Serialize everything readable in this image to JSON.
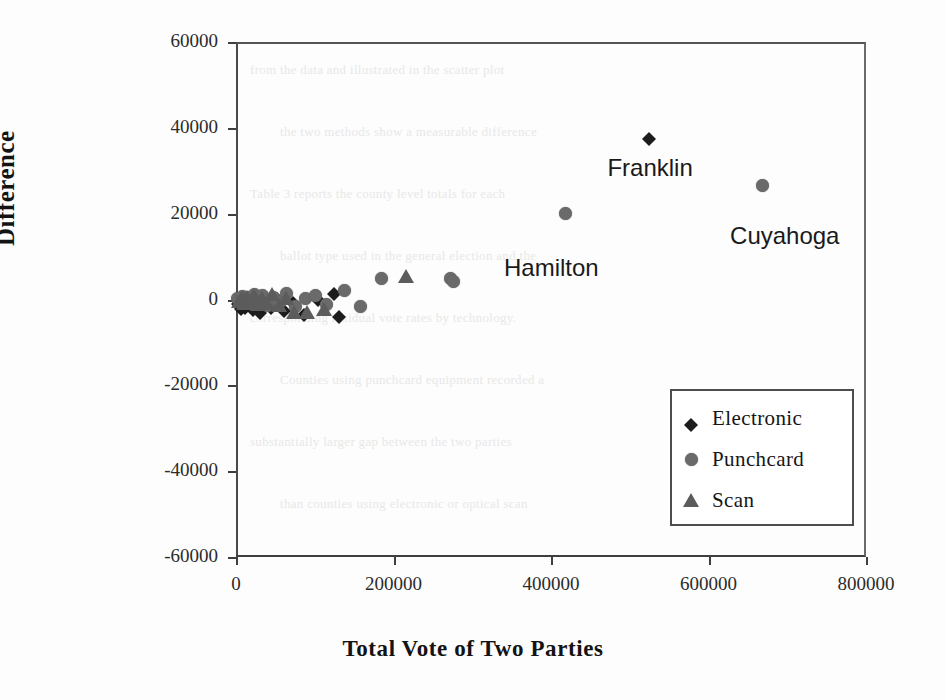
{
  "chart_data": {
    "type": "scatter",
    "title": "",
    "xlabel": "Total Vote of Two Parties",
    "ylabel": "Difference",
    "xlim": [
      0,
      800000
    ],
    "ylim": [
      -60000,
      60000
    ],
    "xticks": [
      "0",
      "200000",
      "400000",
      "600000",
      "800000"
    ],
    "xtick_values": [
      0,
      200000,
      400000,
      600000,
      800000
    ],
    "yticks": [
      "60000",
      "40000",
      "20000",
      "0",
      "-20000",
      "-40000",
      "-60000"
    ],
    "ytick_values": [
      60000,
      40000,
      20000,
      0,
      -20000,
      -40000,
      -60000
    ],
    "grid": false,
    "legend_position": "lower right",
    "series": [
      {
        "name": "Electronic",
        "marker": "diamond",
        "color": "#1c1c1c",
        "points": [
          [
            3000,
            500
          ],
          [
            6000,
            -600
          ],
          [
            9000,
            900
          ],
          [
            12000,
            -300
          ],
          [
            16000,
            1200
          ],
          [
            21000,
            -900
          ],
          [
            26000,
            600
          ],
          [
            31000,
            -1500
          ],
          [
            37000,
            1000
          ],
          [
            44000,
            -400
          ],
          [
            52000,
            1800
          ],
          [
            61000,
            -1100
          ],
          [
            72000,
            700
          ],
          [
            86000,
            -2000
          ],
          [
            104000,
            1500
          ],
          [
            124000,
            3000
          ],
          [
            131000,
            -2500
          ],
          [
            525000,
            39000
          ]
        ]
      },
      {
        "name": "Punchcard",
        "marker": "circle",
        "color": "#6a6a6a",
        "points": [
          [
            2000,
            300
          ],
          [
            5000,
            -500
          ],
          [
            8000,
            800
          ],
          [
            11000,
            -700
          ],
          [
            15000,
            400
          ],
          [
            19000,
            -1000
          ],
          [
            24000,
            1100
          ],
          [
            29000,
            -600
          ],
          [
            34000,
            900
          ],
          [
            40000,
            -1400
          ],
          [
            47000,
            500
          ],
          [
            55000,
            -800
          ],
          [
            64000,
            1300
          ],
          [
            75000,
            -1600
          ],
          [
            88000,
            200
          ],
          [
            101000,
            1000
          ],
          [
            115000,
            -1200
          ],
          [
            138000,
            2000
          ],
          [
            158000,
            -1700
          ],
          [
            185000,
            5000
          ],
          [
            272000,
            5000
          ],
          [
            276000,
            4200
          ],
          [
            419000,
            20000
          ],
          [
            668000,
            26500
          ]
        ]
      },
      {
        "name": "Scan",
        "marker": "triangle",
        "color": "#5c5c5c",
        "points": [
          [
            4000,
            -400
          ],
          [
            7000,
            600
          ],
          [
            10000,
            -900
          ],
          [
            14000,
            500
          ],
          [
            18000,
            -300
          ],
          [
            23000,
            1000
          ],
          [
            28000,
            -1100
          ],
          [
            33000,
            400
          ],
          [
            39000,
            -700
          ],
          [
            46000,
            1200
          ],
          [
            54000,
            -1300
          ],
          [
            63000,
            300
          ],
          [
            74000,
            -2800
          ],
          [
            90000,
            -3000
          ],
          [
            112000,
            -2200
          ],
          [
            216000,
            5500
          ]
        ]
      }
    ],
    "annotations": [
      {
        "label": "Franklin",
        "x": 525000,
        "y": 39000,
        "series": "Electronic"
      },
      {
        "label": "Hamilton",
        "x": 419000,
        "y": 20000,
        "series": "Punchcard"
      },
      {
        "label": "Cuyahoga",
        "x": 668000,
        "y": 26500,
        "series": "Punchcard"
      }
    ]
  },
  "legend": {
    "items": [
      {
        "label": "Electronic",
        "marker": "diamond-marker"
      },
      {
        "label": "Punchcard",
        "marker": "circle-marker"
      },
      {
        "label": "Scan",
        "marker": "triangle-marker"
      }
    ]
  },
  "background_text": [
    "from the data and illustrated in the scatter plot",
    "the two methods show a measurable difference",
    "Table 3 reports the county level totals for each",
    "ballot type used in the general election and the",
    "corresponding residual vote rates by technology.",
    "Counties using punchcard equipment recorded a",
    "substantially larger gap between the two parties",
    "than counties using electronic or optical scan"
  ]
}
